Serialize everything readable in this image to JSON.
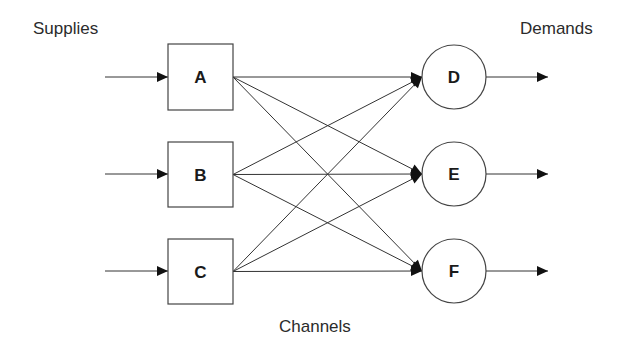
{
  "labels": {
    "supplies": "Supplies",
    "demands": "Demands",
    "channels": "Channels"
  },
  "colors": {
    "line": "#333333",
    "node_border": "#444444",
    "text": "#2b2b2b",
    "background": "#ffffff"
  },
  "supplies": [
    {
      "id": "A",
      "label": "A",
      "shape": "square",
      "x": 168,
      "y": 44,
      "w": 65,
      "h": 66
    },
    {
      "id": "B",
      "label": "B",
      "shape": "square",
      "x": 168,
      "y": 142,
      "w": 65,
      "h": 65
    },
    {
      "id": "C",
      "label": "C",
      "shape": "square",
      "x": 168,
      "y": 239,
      "w": 65,
      "h": 65
    }
  ],
  "demands": [
    {
      "id": "D",
      "label": "D",
      "shape": "circle",
      "cx": 454,
      "cy": 77,
      "r": 32
    },
    {
      "id": "E",
      "label": "E",
      "shape": "circle",
      "cx": 454,
      "cy": 174,
      "r": 32
    },
    {
      "id": "F",
      "label": "F",
      "shape": "circle",
      "cx": 454,
      "cy": 271,
      "r": 32
    }
  ],
  "input_arrows": [
    {
      "to": "A",
      "x1": 105,
      "y": 77,
      "x2": 168
    },
    {
      "to": "B",
      "x1": 105,
      "y": 174,
      "x2": 168
    },
    {
      "to": "C",
      "x1": 105,
      "y": 271,
      "x2": 168
    }
  ],
  "output_arrows": [
    {
      "from": "D",
      "x1": 486,
      "y": 77,
      "x2": 548
    },
    {
      "from": "E",
      "x1": 486,
      "y": 174,
      "x2": 548
    },
    {
      "from": "F",
      "x1": 486,
      "y": 271,
      "x2": 548
    }
  ],
  "channels": [
    {
      "from": "A",
      "to": "D"
    },
    {
      "from": "A",
      "to": "E"
    },
    {
      "from": "A",
      "to": "F"
    },
    {
      "from": "B",
      "to": "D"
    },
    {
      "from": "B",
      "to": "E"
    },
    {
      "from": "B",
      "to": "F"
    },
    {
      "from": "C",
      "to": "D"
    },
    {
      "from": "C",
      "to": "E"
    },
    {
      "from": "C",
      "to": "F"
    }
  ]
}
